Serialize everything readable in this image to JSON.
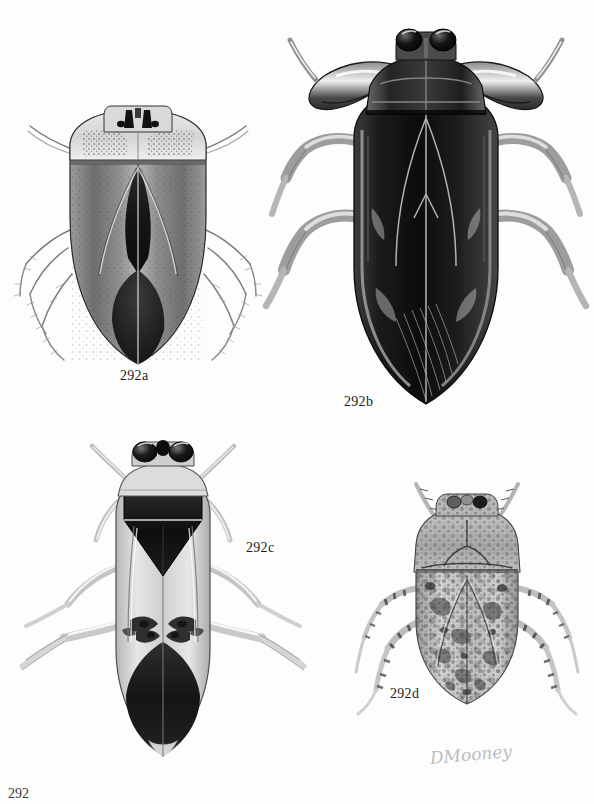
{
  "document": {
    "type": "scientific-illustration-plate",
    "medium": "grayscale pen-and-ink / stipple airbrush rendering",
    "subject": "dorsal habitus views of aquatic true bugs (Hemiptera)",
    "background_color": "#fdfdfd",
    "ink_color": "#1c1c1c",
    "page_number": "292"
  },
  "figures": [
    {
      "id": "292a",
      "label": "292a",
      "label_x": 120,
      "label_y": 368,
      "position": "upper-left",
      "description": "Broad oval water bug, dorsal view. Pale stippled pronotum with dark median markings, mottled hemelytra with dark median stripe, slender hairy legs.",
      "body_tone": "mid gray with dark median",
      "outline_width": 150,
      "outline_height": 250
    },
    {
      "id": "292b",
      "label": "292b",
      "label_x": 344,
      "label_y": 394,
      "position": "upper-right",
      "description": "Large elongate giant water bug, dorsal view. Very dark glossy body, two prominent black compound eyes, broad raptorial forelegs, long sprawling mid and hind legs.",
      "body_tone": "very dark gray to black",
      "outline_width": 125,
      "outline_height": 330
    },
    {
      "id": "292c",
      "label": "292c",
      "label_x": 246,
      "label_y": 540,
      "position": "lower-left",
      "description": "Elongate backswimmer-like bug, dorsal view. Pale body with bold dark triangular scutellum, dark median markings and dark apical third, long oar-like hind legs.",
      "body_tone": "pale gray with black triangular markings",
      "outline_width": 105,
      "outline_height": 280
    },
    {
      "id": "292d",
      "label": "292d",
      "label_x": 390,
      "label_y": 686,
      "position": "lower-right",
      "description": "Rounded mottled creeping water bug, dorsal view. Heavily speckled light-and-dark camouflage pattern over pronotum and hemelytra, banded legs.",
      "body_tone": "light gray, heavily mottled",
      "outline_width": 120,
      "outline_height": 180
    }
  ],
  "signature": {
    "text": "DMooney",
    "x": 430,
    "y": 748,
    "color": "#b9bcc2"
  }
}
